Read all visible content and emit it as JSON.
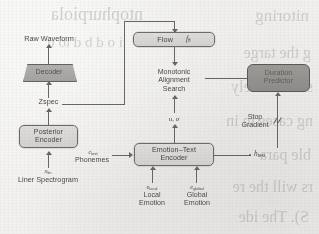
{
  "figure": {
    "kind": "architecture-block-diagram",
    "nodes": {
      "raw_waveform": "Raw Waveform",
      "decoder": "Decoder",
      "zspec": "Zspec",
      "posterior_encoder_line1": "Posterior",
      "posterior_encoder_line2": "Encoder",
      "linear_spectrogram_symbol": "x",
      "linear_spectrogram_sub": "lin",
      "linear_spectrogram_label": "Liner Spectrogram",
      "flow": "Flow",
      "flow_symbol": "f",
      "flow_sub": "θ",
      "mas_line1": "Monotonic",
      "mas_line2": "Alignment",
      "mas_line3": "Search",
      "mu_sigma": "u, σ",
      "duration_predictor_line1": "Duration",
      "duration_predictor_line2": "Predictor",
      "stop_gradient_line1": "Stop",
      "stop_gradient_line2": "Gradient",
      "h_text_symbol": "h",
      "h_text_sub": "text",
      "emotion_text_encoder_line1": "Emotion–Text",
      "emotion_text_encoder_line2": "Encoder",
      "phonemes_symbol": "c",
      "phonemes_sub": "text",
      "phonemes_label": "Phonemes",
      "local_emotion_symbol": "e",
      "local_emotion_sub": "local",
      "local_emotion_line1": "Local",
      "local_emotion_line2": "Emotion",
      "global_emotion_symbol": "e",
      "global_emotion_sub": "global",
      "global_emotion_line1": "Global",
      "global_emotion_line2": "Emotion"
    },
    "colors": {
      "paper": "#f3f1ec",
      "ink": "#4a453d",
      "stroke": "#6a655d",
      "box_light": "#d9d6ce",
      "box_dark": "#949189",
      "trapezoid": "#aca9a1"
    },
    "showthrough_lines": [
      {
        "text": "nitoring",
        "x": 10,
        "y": 6,
        "size": 17
      },
      {
        "text": "g the targe",
        "x": 8,
        "y": 44,
        "size": 16
      },
      {
        "text": "s. Eff ctively",
        "x": 6,
        "y": 78,
        "size": 16
      },
      {
        "text": "ng cases in in",
        "x": 6,
        "y": 112,
        "size": 16
      },
      {
        "text": "ble para",
        "x": 8,
        "y": 146,
        "size": 16
      },
      {
        "text": "rs will the re",
        "x": 6,
        "y": 178,
        "size": 16
      },
      {
        "text": "S). The ide",
        "x": 10,
        "y": 208,
        "size": 16
      },
      {
        "text": "ntophurpiola",
        "x": 176,
        "y": 4,
        "size": 18
      },
      {
        "text": "i o d b d to u",
        "x": 196,
        "y": 34,
        "size": 15
      }
    ]
  }
}
